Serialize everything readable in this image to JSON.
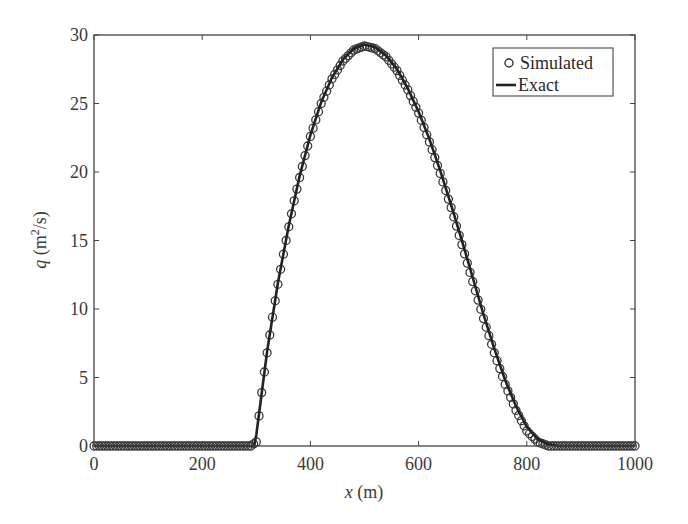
{
  "chart_data": {
    "type": "line",
    "title": "",
    "xlabel": "x (m)",
    "xlabel_var": "x",
    "xlabel_unit": " (m)",
    "ylabel": "q (m^2/s)",
    "ylabel_var": "q",
    "ylabel_unit_pre": " (m",
    "ylabel_unit_sup": "2",
    "ylabel_unit_post": "/s)",
    "xlim": [
      0,
      1000
    ],
    "ylim": [
      0,
      30
    ],
    "xticks": [
      0,
      200,
      400,
      600,
      800,
      1000
    ],
    "yticks": [
      0,
      5,
      10,
      15,
      20,
      25,
      30
    ],
    "grid": false,
    "legend_position": "upper right",
    "series": [
      {
        "name": "Simulated",
        "style": "circle markers",
        "color": "#333333",
        "x": [
          0,
          100,
          200,
          290,
          300,
          305,
          310,
          315,
          320,
          325,
          330,
          340,
          350,
          360,
          370,
          380,
          390,
          400,
          420,
          440,
          460,
          480,
          500,
          520,
          540,
          560,
          580,
          600,
          620,
          640,
          660,
          680,
          700,
          720,
          740,
          760,
          780,
          800,
          820,
          840,
          850,
          860,
          870,
          900,
          950,
          1000
        ],
        "values": [
          0,
          0,
          0,
          0,
          0.3,
          2.2,
          3.9,
          5.4,
          6.8,
          8.1,
          9.4,
          11.8,
          14.0,
          16.0,
          17.9,
          19.6,
          21.2,
          22.6,
          25.0,
          26.8,
          28.1,
          28.9,
          29.2,
          29.0,
          28.4,
          27.4,
          26.0,
          24.3,
          22.2,
          19.9,
          17.4,
          14.7,
          12.0,
          9.3,
          6.8,
          4.5,
          2.6,
          1.1,
          0.3,
          0.0,
          0,
          0,
          0,
          0,
          0,
          0
        ]
      },
      {
        "name": "Exact",
        "style": "solid line",
        "color": "#2a2a2a",
        "x": [
          0,
          296,
          300,
          320,
          340,
          360,
          380,
          400,
          420,
          440,
          460,
          480,
          500,
          520,
          540,
          560,
          580,
          600,
          620,
          640,
          660,
          680,
          700,
          720,
          740,
          760,
          780,
          800,
          820,
          840,
          860,
          870,
          1000
        ],
        "values": [
          0,
          0,
          0.8,
          6.9,
          11.9,
          16.1,
          19.7,
          22.7,
          25.1,
          26.9,
          28.2,
          29.0,
          29.3,
          29.1,
          28.5,
          27.5,
          26.1,
          24.4,
          22.4,
          20.1,
          17.6,
          15.0,
          12.3,
          9.6,
          7.1,
          4.8,
          2.9,
          1.4,
          0.5,
          0.1,
          0.0,
          0,
          0
        ]
      }
    ]
  },
  "legend": {
    "simulated_label": "Simulated",
    "exact_label": "Exact"
  },
  "colors": {
    "axis": "#444444",
    "marker": "#3a3a3a",
    "line": "#222222"
  }
}
